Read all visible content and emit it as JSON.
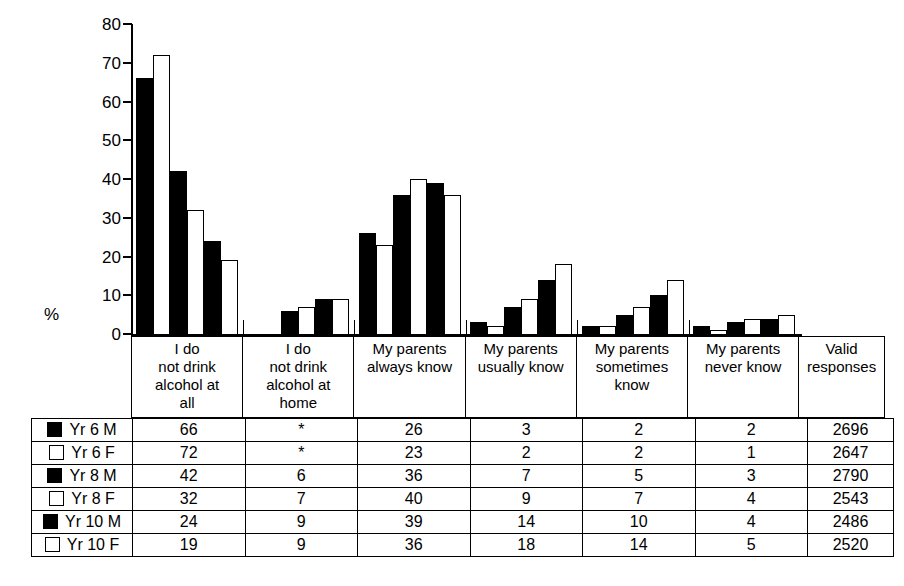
{
  "chart_data": {
    "type": "bar",
    "title": "",
    "xlabel": "",
    "ylabel": "%",
    "ylim": [
      0,
      80
    ],
    "yticks": [
      80,
      70,
      60,
      50,
      40,
      30,
      20,
      10,
      0
    ],
    "grid": false,
    "legend_position": "table-left",
    "categories": [
      "I do not drink alcohol at all",
      "I do not drink alcohol at home",
      "My parents always know",
      "My parents usually know",
      "My parents sometimes know",
      "My parents never know"
    ],
    "series": [
      {
        "name": "Yr 6 M",
        "swatch": "filled",
        "values": [
          66,
          null,
          26,
          3,
          2,
          2
        ],
        "valid_responses": 2696
      },
      {
        "name": "Yr 6 F",
        "swatch": "hollow",
        "values": [
          72,
          null,
          23,
          2,
          2,
          1
        ],
        "valid_responses": 2647
      },
      {
        "name": "Yr 8 M",
        "swatch": "filled",
        "values": [
          42,
          6,
          36,
          7,
          5,
          3
        ],
        "valid_responses": 2790
      },
      {
        "name": "Yr 8 F",
        "swatch": "hollow",
        "values": [
          32,
          7,
          40,
          9,
          7,
          4
        ],
        "valid_responses": 2543
      },
      {
        "name": "Yr 10 M",
        "swatch": "filled",
        "values": [
          24,
          9,
          39,
          14,
          10,
          4
        ],
        "valid_responses": 2486
      },
      {
        "name": "Yr 10 F",
        "swatch": "hollow",
        "values": [
          19,
          9,
          36,
          18,
          14,
          5
        ],
        "valid_responses": 2520
      }
    ],
    "missing_marker": "*"
  },
  "axis": {
    "y_label": "%",
    "ticks": [
      "80",
      "70",
      "60",
      "50",
      "40",
      "30",
      "20",
      "10",
      "0"
    ]
  },
  "header": {
    "cells": [
      [
        "I do",
        "not drink",
        "alcohol at",
        "all"
      ],
      [
        "I do",
        "not drink",
        "alcohol at",
        "home"
      ],
      [
        "My parents",
        "always know"
      ],
      [
        "My parents",
        "usually know"
      ],
      [
        "My parents",
        "sometimes",
        "know"
      ],
      [
        "My parents",
        "never know"
      ],
      [
        "Valid",
        "responses"
      ]
    ]
  },
  "table": {
    "rows": [
      {
        "label": "Yr 6 M",
        "swatch": "filled",
        "cells": [
          "66",
          "*",
          "26",
          "3",
          "2",
          "2",
          "2696"
        ]
      },
      {
        "label": "Yr 6 F",
        "swatch": "hollow",
        "cells": [
          "72",
          "*",
          "23",
          "2",
          "2",
          "1",
          "2647"
        ]
      },
      {
        "label": "Yr 8 M",
        "swatch": "filled",
        "cells": [
          "42",
          "6",
          "36",
          "7",
          "5",
          "3",
          "2790"
        ]
      },
      {
        "label": "Yr 8 F",
        "swatch": "hollow",
        "cells": [
          "32",
          "7",
          "40",
          "9",
          "7",
          "4",
          "2543"
        ]
      },
      {
        "label": "Yr 10 M",
        "swatch": "filled",
        "cells": [
          "24",
          "9",
          "39",
          "14",
          "10",
          "4",
          "2486"
        ]
      },
      {
        "label": "Yr 10 F",
        "swatch": "hollow",
        "cells": [
          "19",
          "9",
          "36",
          "18",
          "14",
          "5",
          "2520"
        ]
      }
    ]
  },
  "colors": {
    "ink": "#000000",
    "paper": "#ffffff"
  }
}
